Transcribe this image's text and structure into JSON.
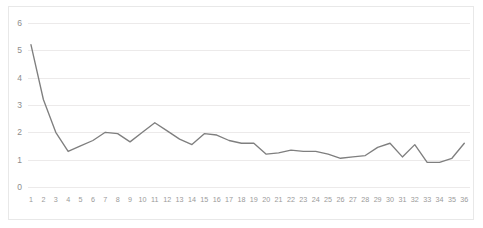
{
  "chart_data": {
    "type": "line",
    "title": "",
    "subtitle": "",
    "xlabel": "",
    "ylabel": "",
    "grid": true,
    "legend": false,
    "legend_position": "none",
    "line_color": "#7f7f7f",
    "gridline_color": "#eceaea",
    "axis_label_color": "#8d8d8d",
    "categories": [
      "1",
      "2",
      "3",
      "4",
      "5",
      "6",
      "7",
      "8",
      "9",
      "10",
      "11",
      "12",
      "13",
      "14",
      "15",
      "16",
      "17",
      "18",
      "19",
      "20",
      "21",
      "22",
      "23",
      "24",
      "25",
      "26",
      "27",
      "28",
      "29",
      "30",
      "31",
      "32",
      "33",
      "34",
      "35",
      "36"
    ],
    "x": [
      1,
      2,
      3,
      4,
      5,
      6,
      7,
      8,
      9,
      10,
      11,
      12,
      13,
      14,
      15,
      16,
      17,
      18,
      19,
      20,
      21,
      22,
      23,
      24,
      25,
      26,
      27,
      28,
      29,
      30,
      31,
      32,
      33,
      34,
      35,
      36
    ],
    "values": [
      5.2,
      3.2,
      2.0,
      1.3,
      1.5,
      1.7,
      2.0,
      1.95,
      1.65,
      2.0,
      2.35,
      2.05,
      1.75,
      1.55,
      1.95,
      1.9,
      1.7,
      1.6,
      1.6,
      1.2,
      1.25,
      1.35,
      1.3,
      1.3,
      1.2,
      1.05,
      1.1,
      1.15,
      1.45,
      1.6,
      1.1,
      1.55,
      0.9,
      0.9,
      1.05,
      1.6
    ],
    "series": [
      {
        "name": "",
        "values": [
          5.2,
          3.2,
          2.0,
          1.3,
          1.5,
          1.7,
          2.0,
          1.95,
          1.65,
          2.0,
          2.35,
          2.05,
          1.75,
          1.55,
          1.95,
          1.9,
          1.7,
          1.6,
          1.6,
          1.2,
          1.25,
          1.35,
          1.3,
          1.3,
          1.2,
          1.05,
          1.1,
          1.15,
          1.45,
          1.6,
          1.1,
          1.55,
          0.9,
          0.9,
          1.05,
          1.6
        ]
      }
    ],
    "yticks": [
      0,
      1,
      2,
      3,
      4,
      5,
      6
    ],
    "ytick_labels": [
      "0",
      "1",
      "2",
      "3",
      "4",
      "5",
      "6"
    ],
    "ylim": [
      0,
      6
    ],
    "xlim": [
      1,
      36
    ]
  }
}
